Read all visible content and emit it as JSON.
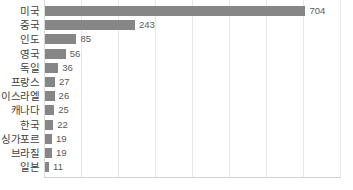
{
  "chart_data": {
    "type": "bar",
    "orientation": "horizontal",
    "title": "",
    "subtitle": "",
    "xlabel": "",
    "ylabel": "",
    "categories": [
      "미국",
      "중국",
      "인도",
      "영국",
      "독일",
      "프랑스",
      "이스라엘",
      "캐나다",
      "한국",
      "싱가포르",
      "브라질",
      "일본"
    ],
    "values": [
      704,
      243,
      85,
      56,
      36,
      27,
      26,
      25,
      22,
      19,
      19,
      11
    ],
    "value_labels": [
      "704",
      "243",
      "85",
      "56",
      "36",
      "27",
      "26",
      "25",
      "22",
      "19",
      "19",
      "11"
    ],
    "xlim": [
      0,
      800
    ],
    "gridline_values": [
      0,
      100,
      200,
      300,
      400,
      500,
      600,
      700,
      800
    ],
    "grid": true,
    "legend": "none",
    "bar_color": "#868686",
    "gridline_color": "#e8e8e8",
    "axis_color": "#d0d0d0",
    "label_color": "#3f3f3f",
    "value_color": "#5a5a5a",
    "background_color": "#ffffff"
  }
}
